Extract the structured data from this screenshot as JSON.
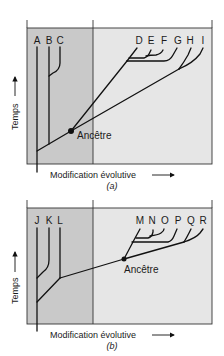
{
  "colors": {
    "shaded_region": "#c9c9c9",
    "light_region": "#e6e6e6",
    "line": "#111111",
    "background": "#ffffff"
  },
  "panel_a": {
    "caption": "(a)",
    "x_axis_label": "Modification évolutive",
    "y_axis_label": "Temps",
    "ancestor_label": "Ancêtre",
    "taxa": [
      "A",
      "B",
      "C",
      "D",
      "E",
      "F",
      "G",
      "H",
      "I"
    ]
  },
  "panel_b": {
    "caption": "(b)",
    "x_axis_label": "Modification évolutive",
    "y_axis_label": "Temps",
    "ancestor_label": "Ancêtre",
    "taxa": [
      "J",
      "K",
      "L",
      "M",
      "N",
      "O",
      "P",
      "Q",
      "R"
    ]
  }
}
